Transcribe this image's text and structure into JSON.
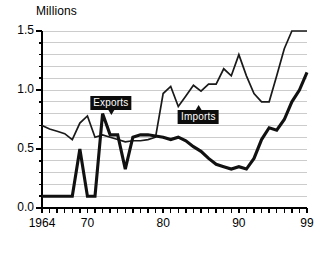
{
  "chart_data": {
    "type": "line",
    "title": "",
    "ylabel": "Millions",
    "xlabel": "",
    "ylim": [
      0.0,
      1.5
    ],
    "xlim": [
      1964,
      1999
    ],
    "grid": true,
    "grid_minor_step": 0.1,
    "legend_position": "inline-annotations",
    "y_ticks_major": [
      "0.0",
      "0.5",
      "1.0",
      "1.5"
    ],
    "y_tick_values": [
      0.0,
      0.5,
      1.0,
      1.5
    ],
    "x_tick_labels": [
      "1964",
      "70",
      "80",
      "90",
      "99"
    ],
    "x_tick_values": [
      1964,
      1970,
      1980,
      1990,
      1999
    ],
    "x": [
      1964,
      1965,
      1966,
      1967,
      1968,
      1969,
      1970,
      1971,
      1972,
      1973,
      1974,
      1975,
      1976,
      1977,
      1978,
      1979,
      1980,
      1981,
      1982,
      1983,
      1984,
      1985,
      1986,
      1987,
      1988,
      1989,
      1990,
      1991,
      1992,
      1993,
      1994,
      1995,
      1996,
      1997,
      1998,
      1999
    ],
    "series": [
      {
        "name": "Imports",
        "style": "thin",
        "color": "#1a1a1a",
        "values": [
          0.7,
          0.67,
          0.65,
          0.63,
          0.58,
          0.72,
          0.78,
          0.6,
          0.62,
          0.6,
          0.58,
          0.56,
          0.57,
          0.57,
          0.58,
          0.6,
          0.97,
          1.03,
          0.86,
          0.95,
          1.04,
          0.99,
          1.05,
          1.05,
          1.18,
          1.12,
          1.3,
          1.12,
          0.97,
          0.9,
          0.9,
          1.12,
          1.35,
          1.5,
          1.5,
          1.5
        ]
      },
      {
        "name": "Exports",
        "style": "thick",
        "color": "#111111",
        "values": [
          0.1,
          0.1,
          0.1,
          0.1,
          0.1,
          0.5,
          0.1,
          0.1,
          0.8,
          0.62,
          0.62,
          0.33,
          0.6,
          0.62,
          0.62,
          0.61,
          0.6,
          0.58,
          0.6,
          0.57,
          0.52,
          0.48,
          0.42,
          0.37,
          0.35,
          0.33,
          0.35,
          0.33,
          0.42,
          0.58,
          0.68,
          0.66,
          0.75,
          0.9,
          1.0,
          1.15
        ]
      }
    ],
    "annotations": [
      {
        "label": "Exports",
        "points_to_series": "Exports",
        "pointer": "down",
        "x_pct": 26.0,
        "y_px": 96
      },
      {
        "label": "Imports",
        "points_to_series": "Imports",
        "pointer": "up",
        "x_pct": 59.0,
        "y_px": 110
      }
    ]
  }
}
